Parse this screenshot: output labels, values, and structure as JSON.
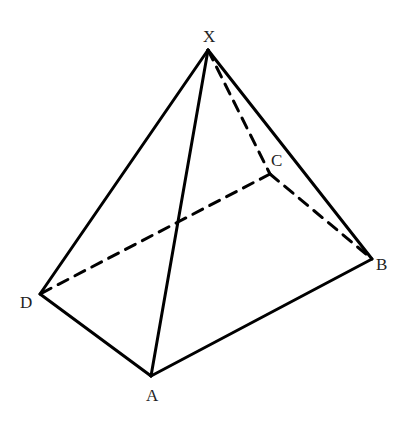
{
  "diagram": {
    "vertices": {
      "X": {
        "x": 208,
        "y": 50,
        "label": "X",
        "lx": 203,
        "ly": 42
      },
      "C": {
        "x": 270,
        "y": 174,
        "label": "C",
        "lx": 271,
        "ly": 166
      },
      "B": {
        "x": 372,
        "y": 259,
        "label": "B",
        "lx": 376,
        "ly": 270
      },
      "D": {
        "x": 40,
        "y": 294,
        "label": "D",
        "lx": 20,
        "ly": 308
      },
      "A": {
        "x": 151,
        "y": 376,
        "label": "A",
        "lx": 146,
        "ly": 401
      }
    },
    "solid_edges": [
      [
        "X",
        "D"
      ],
      [
        "X",
        "A"
      ],
      [
        "X",
        "B"
      ],
      [
        "D",
        "A"
      ],
      [
        "A",
        "B"
      ]
    ],
    "dashed_edges": [
      [
        "X",
        "C"
      ],
      [
        "C",
        "B"
      ],
      [
        "C",
        "D"
      ]
    ],
    "line_color": "#000000"
  }
}
